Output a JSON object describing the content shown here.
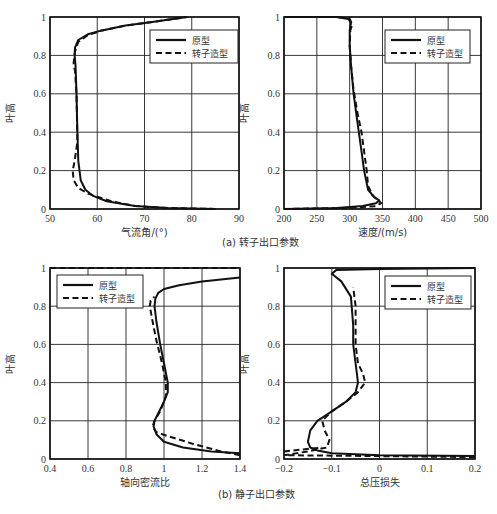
{
  "figure_caption": "",
  "captions": {
    "a": "(a) 转子出口参数",
    "b": "(b) 静子出口参数"
  },
  "legend": {
    "solid": "原型",
    "dashed": "转子造型"
  },
  "chart_data": [
    {
      "id": "a_left",
      "type": "line",
      "title": "",
      "xlabel": "气流角/(°)",
      "ylabel": "叶高",
      "xlim": [
        50,
        90
      ],
      "ylim": [
        0,
        1
      ],
      "xticks": [
        50,
        60,
        70,
        80,
        90
      ],
      "yticks": [
        0,
        0.2,
        0.4,
        0.6,
        0.8,
        1
      ],
      "grid": true,
      "legend_position": "upper right",
      "series": [
        {
          "name": "原型",
          "style": "solid",
          "x": [
            85,
            75,
            68,
            62,
            59,
            57.5,
            56.5,
            56,
            55.8,
            55.6,
            55.4,
            55.2,
            55.3,
            56,
            58,
            61,
            66,
            72,
            79
          ],
          "y": [
            0.0,
            0.005,
            0.015,
            0.04,
            0.07,
            0.1,
            0.15,
            0.25,
            0.4,
            0.6,
            0.75,
            0.8,
            0.84,
            0.88,
            0.91,
            0.93,
            0.955,
            0.975,
            1.0
          ]
        },
        {
          "name": "转子造型",
          "style": "dashed",
          "x": [
            85,
            75,
            68,
            63,
            58,
            56,
            55,
            54.8,
            55.2,
            55.8,
            55.6,
            55.3,
            55,
            55.3,
            56,
            58,
            61,
            66,
            72,
            79
          ],
          "y": [
            0.0,
            0.005,
            0.015,
            0.04,
            0.08,
            0.11,
            0.15,
            0.2,
            0.25,
            0.35,
            0.6,
            0.72,
            0.76,
            0.82,
            0.87,
            0.905,
            0.93,
            0.955,
            0.975,
            1.0
          ]
        }
      ]
    },
    {
      "id": "a_right",
      "type": "line",
      "title": "",
      "xlabel": "速度/(m/s)",
      "ylabel": "叶高",
      "xlim": [
        200,
        500
      ],
      "ylim": [
        0,
        1
      ],
      "xticks": [
        200,
        250,
        300,
        350,
        400,
        450,
        500
      ],
      "yticks": [
        0,
        0.2,
        0.4,
        0.6,
        0.8,
        1
      ],
      "grid": true,
      "legend_position": "upper right",
      "series": [
        {
          "name": "原型",
          "style": "solid",
          "x": [
            200,
            280,
            320,
            340,
            345,
            338,
            328,
            322,
            318,
            312,
            306,
            302,
            300,
            300,
            302,
            298,
            280,
            200
          ],
          "y": [
            0.0,
            0.005,
            0.015,
            0.03,
            0.045,
            0.06,
            0.1,
            0.2,
            0.3,
            0.45,
            0.6,
            0.75,
            0.85,
            0.93,
            0.97,
            0.99,
            1.0,
            1.0
          ]
        },
        {
          "name": "转子造型",
          "style": "dashed",
          "x": [
            200,
            300,
            340,
            348,
            345,
            335,
            328,
            326,
            322,
            318,
            312,
            306,
            302,
            300,
            301,
            304,
            300,
            280,
            200
          ],
          "y": [
            0.0,
            0.005,
            0.015,
            0.03,
            0.04,
            0.07,
            0.12,
            0.2,
            0.3,
            0.4,
            0.5,
            0.62,
            0.75,
            0.85,
            0.93,
            0.96,
            0.99,
            1.0,
            1.0
          ]
        }
      ]
    },
    {
      "id": "b_left",
      "type": "line",
      "title": "",
      "xlabel": "轴向密流比",
      "ylabel": "叶高",
      "xlim": [
        0.4,
        1.4
      ],
      "ylim": [
        0,
        1
      ],
      "xticks": [
        0.4,
        0.6,
        0.8,
        1,
        1.2,
        1.4
      ],
      "yticks": [
        0,
        0.2,
        0.4,
        0.6,
        0.8,
        1
      ],
      "grid": true,
      "legend_position": "upper left",
      "series": [
        {
          "name": "原型",
          "style": "solid",
          "x": [
            1.4,
            1.25,
            1.1,
            1.0,
            0.96,
            0.945,
            0.95,
            0.97,
            1.0,
            1.02,
            1.02,
            1.0,
            0.98,
            0.96,
            0.95,
            0.955,
            0.97,
            1.0,
            1.08,
            1.2,
            1.4
          ],
          "y": [
            0.03,
            0.04,
            0.06,
            0.09,
            0.13,
            0.17,
            0.2,
            0.24,
            0.3,
            0.35,
            0.4,
            0.5,
            0.6,
            0.72,
            0.8,
            0.84,
            0.87,
            0.89,
            0.91,
            0.93,
            0.95
          ]
        },
        {
          "name": "转子造型",
          "style": "dashed",
          "x": [
            1.4,
            1.3,
            1.15,
            1.02,
            0.96,
            0.94,
            0.95,
            0.98,
            1.01,
            1.01,
            0.99,
            0.96,
            0.94,
            0.925,
            0.93,
            0.95
          ],
          "y": [
            0.02,
            0.04,
            0.08,
            0.12,
            0.14,
            0.17,
            0.2,
            0.25,
            0.33,
            0.4,
            0.5,
            0.62,
            0.72,
            0.8,
            0.83,
            0.85
          ]
        },
        {
          "name": "转子造型-tip",
          "style": "dashed",
          "x": [
            0.4,
            1.4
          ],
          "y": [
            1.0,
            1.0
          ]
        }
      ]
    },
    {
      "id": "b_right",
      "type": "line",
      "title": "",
      "xlabel": "总压损失",
      "ylabel": "叶高",
      "xlim": [
        -0.2,
        0.2
      ],
      "ylim": [
        0,
        1
      ],
      "xticks": [
        -0.2,
        -0.1,
        0,
        0.1,
        0.2
      ],
      "yticks": [
        0,
        0.2,
        0.4,
        0.6,
        0.8,
        1
      ],
      "grid": true,
      "legend_position": "upper right",
      "series": [
        {
          "name": "原型",
          "style": "solid",
          "x": [
            0.2,
            0.0,
            -0.1,
            -0.13,
            -0.145,
            -0.15,
            -0.145,
            -0.13,
            -0.1,
            -0.07,
            -0.05,
            -0.045,
            -0.05,
            -0.055,
            -0.055,
            -0.06,
            -0.08,
            -0.1,
            -0.09,
            0.0,
            0.2
          ],
          "y": [
            0.015,
            0.02,
            0.03,
            0.045,
            0.06,
            0.09,
            0.15,
            0.2,
            0.25,
            0.3,
            0.35,
            0.4,
            0.5,
            0.6,
            0.7,
            0.85,
            0.93,
            0.97,
            0.99,
            0.995,
            1.0
          ]
        },
        {
          "name": "转子造型",
          "style": "dashed",
          "x": [
            0.2,
            0.0,
            -0.2,
            -0.15,
            -0.11,
            -0.105,
            -0.115,
            -0.12,
            -0.1,
            -0.07,
            -0.045,
            -0.03,
            -0.035,
            -0.045,
            -0.05,
            -0.05,
            -0.05,
            -0.055
          ],
          "y": [
            0.01,
            0.015,
            0.02,
            0.04,
            0.06,
            0.1,
            0.15,
            0.2,
            0.25,
            0.3,
            0.35,
            0.4,
            0.45,
            0.5,
            0.6,
            0.7,
            0.8,
            0.9
          ]
        },
        {
          "name": "转子造型-hub",
          "style": "dashed",
          "x": [
            -0.2,
            -0.16,
            -0.12
          ],
          "y": [
            0.04,
            0.05,
            0.06
          ]
        }
      ]
    }
  ]
}
